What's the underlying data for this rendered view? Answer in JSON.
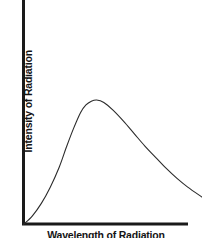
{
  "figure": {
    "background_color": "#ffffff",
    "width": 202,
    "height": 238,
    "axis_color": "#1a1a1a",
    "curve_color": "#2b2b2b"
  },
  "chart_data": {
    "type": "line",
    "title": "",
    "subtitle": "",
    "xlabel": "Wavelength of Radiation",
    "ylabel": "Intensity of Radiation",
    "xlim": [
      0,
      1
    ],
    "ylim": [
      0,
      1
    ],
    "grid": false,
    "legend": false,
    "legend_position": "none",
    "xticks": [],
    "yticks": [],
    "xticklabels": [],
    "yticklabels": [],
    "annotations": [],
    "series": [
      {
        "name": "Blackbody emission curve",
        "x": [
          0.0,
          0.05,
          0.1,
          0.15,
          0.2,
          0.24,
          0.28,
          0.32,
          0.35,
          0.38,
          0.41,
          0.45,
          0.5,
          0.56,
          0.62,
          0.68,
          0.74,
          0.8,
          0.86,
          0.92,
          1.0
        ],
        "values": [
          0.0,
          0.07,
          0.17,
          0.3,
          0.46,
          0.62,
          0.77,
          0.9,
          0.96,
          0.99,
          1.0,
          0.98,
          0.92,
          0.83,
          0.73,
          0.63,
          0.54,
          0.45,
          0.37,
          0.3,
          0.22
        ]
      }
    ],
    "peak": {
      "x": 0.41,
      "y": 1.0
    }
  },
  "labels": {
    "y_axis": "Intensity of Radiation",
    "x_axis": "Wavelength of Radiation"
  }
}
